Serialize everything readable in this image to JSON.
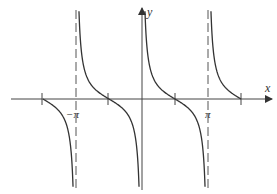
{
  "figure": {
    "function": "y = cot x",
    "x_axis_label": "x",
    "y_axis_label": "y",
    "tick_labels": [
      {
        "text": "−π",
        "x_value": "-pi"
      },
      {
        "text": "π",
        "x_value": "pi"
      }
    ],
    "asymptotes": [
      "-pi",
      "0",
      "pi"
    ],
    "zeros": [
      "-3pi/2",
      "-pi/2",
      "pi/2",
      "3pi/2"
    ],
    "colors": {
      "curve": "#333333",
      "axis": "#444444",
      "asymptote": "#555555"
    }
  }
}
